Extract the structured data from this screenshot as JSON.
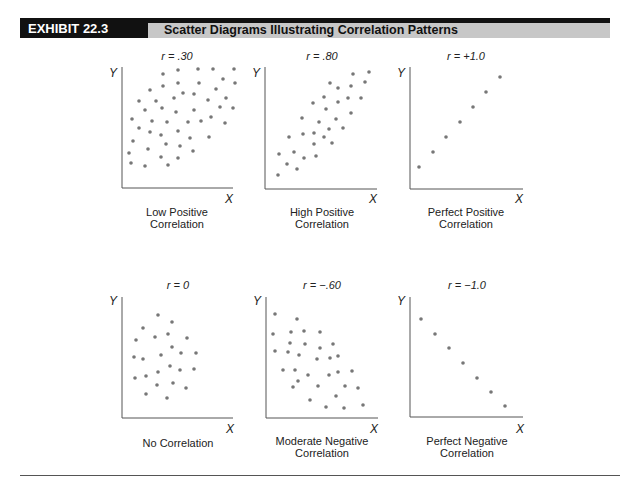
{
  "header": {
    "exhibit": "EXHIBIT 22.3",
    "title": "Scatter Diagrams Illustrating Correlation Patterns"
  },
  "colors": {
    "header_black": "#111111",
    "header_grey": "#c7c7c7",
    "dot": "#777777",
    "axis": "#555555"
  },
  "chart_data": [
    {
      "type": "scatter",
      "title": "r = .30",
      "r": 0.3,
      "caption": [
        "Low Positive",
        "Correlation"
      ],
      "xlabel": "X",
      "ylabel": "Y",
      "frame": {
        "x0": 122,
        "y0": 188,
        "x1": 233,
        "ytop": 67,
        "cx": 177,
        "ty": 60,
        "ylabx": 113,
        "ylaby": 77,
        "xlabx": 229,
        "xlaby": 203,
        "cap1y": 216,
        "cap2y": 228
      },
      "points": [
        [
          163,
          74
        ],
        [
          178,
          70
        ],
        [
          198,
          69
        ],
        [
          213,
          69
        ],
        [
          234,
          69
        ],
        [
          223,
          79
        ],
        [
          235,
          83
        ],
        [
          163,
          86
        ],
        [
          178,
          83
        ],
        [
          199,
          83
        ],
        [
          150,
          90
        ],
        [
          183,
          93
        ],
        [
          194,
          94
        ],
        [
          216,
          89
        ],
        [
          139,
          101
        ],
        [
          156,
          101
        ],
        [
          174,
          98
        ],
        [
          208,
          100
        ],
        [
          226,
          98
        ],
        [
          145,
          110
        ],
        [
          162,
          108
        ],
        [
          176,
          112
        ],
        [
          194,
          110
        ],
        [
          220,
          107
        ],
        [
          233,
          108
        ],
        [
          132,
          119
        ],
        [
          152,
          121
        ],
        [
          167,
          122
        ],
        [
          188,
          122
        ],
        [
          201,
          121
        ],
        [
          211,
          117
        ],
        [
          225,
          123
        ],
        [
          139,
          128
        ],
        [
          150,
          132
        ],
        [
          161,
          135
        ],
        [
          178,
          131
        ],
        [
          190,
          138
        ],
        [
          209,
          137
        ],
        [
          133,
          141
        ],
        [
          148,
          149
        ],
        [
          166,
          144
        ],
        [
          180,
          146
        ],
        [
          193,
          151
        ],
        [
          129,
          153
        ],
        [
          161,
          157
        ],
        [
          178,
          158
        ],
        [
          131,
          163
        ],
        [
          145,
          166
        ],
        [
          168,
          165
        ]
      ]
    },
    {
      "type": "scatter",
      "title": "r = .80",
      "r": 0.8,
      "caption": [
        "High Positive",
        "Correlation"
      ],
      "xlabel": "X",
      "ylabel": "Y",
      "frame": {
        "x0": 265,
        "y0": 189,
        "x1": 377,
        "ytop": 67,
        "cx": 322,
        "ty": 60,
        "ylabx": 256,
        "ylaby": 77,
        "xlabx": 373,
        "xlaby": 203,
        "cap1y": 216,
        "cap2y": 228
      },
      "points": [
        [
          353,
          74
        ],
        [
          369,
          72
        ],
        [
          330,
          83
        ],
        [
          338,
          88
        ],
        [
          351,
          86
        ],
        [
          365,
          82
        ],
        [
          324,
          97
        ],
        [
          338,
          102
        ],
        [
          348,
          98
        ],
        [
          361,
          98
        ],
        [
          313,
          103
        ],
        [
          326,
          109
        ],
        [
          351,
          113
        ],
        [
          302,
          118
        ],
        [
          319,
          122
        ],
        [
          336,
          119
        ],
        [
          289,
          137
        ],
        [
          303,
          134
        ],
        [
          314,
          133
        ],
        [
          324,
          137
        ],
        [
          329,
          129
        ],
        [
          343,
          128
        ],
        [
          314,
          144
        ],
        [
          332,
          143
        ],
        [
          279,
          154
        ],
        [
          294,
          152
        ],
        [
          304,
          158
        ],
        [
          316,
          156
        ],
        [
          287,
          164
        ],
        [
          297,
          169
        ],
        [
          278,
          175
        ]
      ]
    },
    {
      "type": "scatter",
      "title": "r = +1.0",
      "r": 1.0,
      "caption": [
        "Perfect Positive",
        "Correlation"
      ],
      "xlabel": "X",
      "ylabel": "Y",
      "frame": {
        "x0": 410,
        "y0": 189,
        "x1": 523,
        "ytop": 67,
        "cx": 466,
        "ty": 60,
        "ylabx": 401,
        "ylaby": 77,
        "xlabx": 519,
        "xlaby": 203,
        "cap1y": 216,
        "cap2y": 228
      },
      "points": [
        [
          419,
          167
        ],
        [
          433,
          152
        ],
        [
          446,
          137
        ],
        [
          460,
          122
        ],
        [
          473,
          107
        ],
        [
          486,
          92
        ],
        [
          500,
          77
        ]
      ]
    },
    {
      "type": "scatter",
      "title": "r = 0",
      "r": 0,
      "caption": [
        "No Correlation"
      ],
      "xlabel": "X",
      "ylabel": "Y",
      "frame": {
        "x0": 122,
        "y0": 418,
        "x1": 233,
        "ytop": 297,
        "cx": 178,
        "ty": 289,
        "ylabx": 113,
        "ylaby": 305,
        "xlabx": 230,
        "xlaby": 433,
        "cap1y": 447,
        "cap2y": 0
      },
      "points": [
        [
          158,
          315
        ],
        [
          172,
          322
        ],
        [
          143,
          328
        ],
        [
          155,
          337
        ],
        [
          168,
          334
        ],
        [
          136,
          340
        ],
        [
          187,
          338
        ],
        [
          172,
          347
        ],
        [
          134,
          357
        ],
        [
          143,
          359
        ],
        [
          161,
          355
        ],
        [
          181,
          353
        ],
        [
          196,
          353
        ],
        [
          170,
          366
        ],
        [
          180,
          370
        ],
        [
          194,
          369
        ],
        [
          158,
          372
        ],
        [
          135,
          378
        ],
        [
          146,
          376
        ],
        [
          157,
          385
        ],
        [
          173,
          383
        ],
        [
          186,
          388
        ],
        [
          146,
          394
        ],
        [
          167,
          398
        ]
      ]
    },
    {
      "type": "scatter",
      "title": "r = −.60",
      "r": -0.6,
      "caption": [
        "Moderate Negative",
        "Correlation"
      ],
      "xlabel": "X",
      "ylabel": "Y",
      "frame": {
        "x0": 266,
        "y0": 418,
        "x1": 378,
        "ytop": 297,
        "cx": 322,
        "ty": 289,
        "ylabx": 257,
        "ylaby": 305,
        "xlabx": 374,
        "xlaby": 433,
        "cap1y": 445,
        "cap2y": 457
      },
      "points": [
        [
          275,
          314
        ],
        [
          297,
          319
        ],
        [
          273,
          334
        ],
        [
          291,
          332
        ],
        [
          304,
          331
        ],
        [
          320,
          332
        ],
        [
          290,
          343
        ],
        [
          305,
          344
        ],
        [
          333,
          344
        ],
        [
          275,
          351
        ],
        [
          288,
          352
        ],
        [
          299,
          355
        ],
        [
          320,
          348
        ],
        [
          317,
          359
        ],
        [
          330,
          358
        ],
        [
          338,
          356
        ],
        [
          283,
          370
        ],
        [
          295,
          370
        ],
        [
          308,
          375
        ],
        [
          329,
          375
        ],
        [
          338,
          372
        ],
        [
          352,
          371
        ],
        [
          298,
          381
        ],
        [
          293,
          387
        ],
        [
          318,
          386
        ],
        [
          345,
          386
        ],
        [
          358,
          388
        ],
        [
          336,
          396
        ],
        [
          310,
          400
        ],
        [
          326,
          407
        ],
        [
          344,
          408
        ],
        [
          363,
          405
        ]
      ]
    },
    {
      "type": "scatter",
      "title": "r = −1.0",
      "r": -1.0,
      "caption": [
        "Perfect Negative",
        "Correlation"
      ],
      "xlabel": "X",
      "ylabel": "Y",
      "frame": {
        "x0": 410,
        "y0": 417,
        "x1": 523,
        "ytop": 297,
        "cx": 467,
        "ty": 289,
        "ylabx": 401,
        "ylaby": 305,
        "xlabx": 520,
        "xlaby": 433,
        "cap1y": 445,
        "cap2y": 457
      },
      "points": [
        [
          421,
          319
        ],
        [
          435,
          334
        ],
        [
          449,
          348
        ],
        [
          463,
          363
        ],
        [
          477,
          378
        ],
        [
          491,
          392
        ],
        [
          505,
          406
        ]
      ]
    }
  ]
}
